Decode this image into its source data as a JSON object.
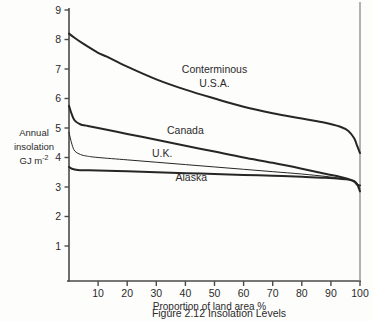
{
  "caption": "Figure 2.12   Insolation Levels",
  "chart_data": {
    "type": "line",
    "title": "Insolation Levels",
    "xlabel": "Proportion of land area %",
    "ylabel_line1": "Annual",
    "ylabel_line2": "insolation",
    "ylabel_line3": "GJ m",
    "ylabel_exponent": "-2",
    "xlim": [
      0,
      100
    ],
    "ylim": [
      0,
      9
    ],
    "xticks": [
      10,
      20,
      30,
      40,
      50,
      60,
      70,
      80,
      90,
      100
    ],
    "yticks": [
      1,
      2,
      3,
      4,
      5,
      6,
      7,
      8,
      9
    ],
    "grid": false,
    "legend": "inline-labels",
    "line_color": "#262626",
    "axis_color": "#4a4a4a",
    "series": [
      {
        "name": "Conterminous U.S.A.",
        "label": "Conterminous",
        "label2": "U.S.A.",
        "width": 2.0,
        "x": [
          0,
          2,
          5,
          10,
          13,
          20,
          30,
          40,
          50,
          60,
          70,
          80,
          88,
          93,
          96,
          98,
          99,
          100
        ],
        "y": [
          8.2,
          8.05,
          7.85,
          7.55,
          7.42,
          7.08,
          6.65,
          6.3,
          6.0,
          5.72,
          5.5,
          5.32,
          5.18,
          5.05,
          4.9,
          4.65,
          4.4,
          4.15
        ]
      },
      {
        "name": "Canada",
        "label": "Canada",
        "width": 2.0,
        "x": [
          0,
          1,
          2,
          4,
          6,
          10,
          20,
          30,
          40,
          50,
          60,
          70,
          80,
          88,
          93,
          96,
          98,
          99,
          100
        ],
        "y": [
          5.75,
          5.45,
          5.25,
          5.12,
          5.08,
          5.0,
          4.8,
          4.6,
          4.4,
          4.2,
          4.0,
          3.82,
          3.62,
          3.45,
          3.35,
          3.27,
          3.2,
          3.1,
          2.85
        ]
      },
      {
        "name": "U.K.",
        "label": "U.K.",
        "width": 1.0,
        "x": [
          0,
          1,
          2,
          4,
          6,
          10,
          20,
          30,
          40,
          50,
          60,
          70,
          80,
          88,
          93,
          96,
          98,
          99,
          100
        ],
        "y": [
          4.85,
          4.45,
          4.22,
          4.1,
          4.05,
          4.0,
          3.92,
          3.84,
          3.76,
          3.68,
          3.6,
          3.52,
          3.44,
          3.36,
          3.3,
          3.26,
          3.2,
          3.1,
          2.95
        ]
      },
      {
        "name": "Alaska",
        "label": "Alaska",
        "width": 2.0,
        "x": [
          0,
          1,
          3,
          6,
          10,
          20,
          30,
          40,
          50,
          60,
          70,
          80,
          88,
          93,
          96,
          98,
          99,
          100
        ],
        "y": [
          3.68,
          3.62,
          3.58,
          3.57,
          3.56,
          3.53,
          3.5,
          3.47,
          3.44,
          3.41,
          3.38,
          3.35,
          3.31,
          3.28,
          3.25,
          3.18,
          3.08,
          3.05
        ]
      }
    ],
    "annotations": [
      {
        "text": "Conterminous",
        "x": 50,
        "y": 6.88
      },
      {
        "text": "U.S.A.",
        "x": 50,
        "y": 6.38
      },
      {
        "text": "Canada",
        "x": 40,
        "y": 4.78
      },
      {
        "text": "U.K.",
        "x": 32,
        "y": 4.02
      },
      {
        "text": "Alaska",
        "x": 42,
        "y": 3.22
      }
    ]
  }
}
